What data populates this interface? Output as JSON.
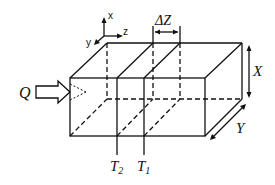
{
  "diagram": {
    "type": "3d-box-with-slices",
    "labels": {
      "flow": "Q",
      "slice_width": "ΔZ",
      "height": "X",
      "depth": "Y",
      "slice_left": "T",
      "slice_left_sub": "2",
      "slice_right": "T",
      "slice_right_sub": "1"
    },
    "axes": {
      "x": "x",
      "y": "y",
      "z": "z"
    },
    "colors": {
      "line": "#111111",
      "background": "#ffffff"
    }
  }
}
